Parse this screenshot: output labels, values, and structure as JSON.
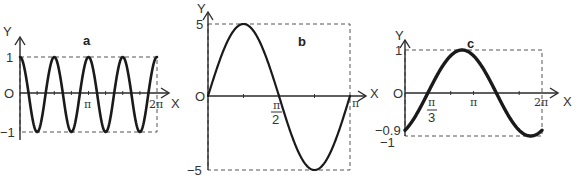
{
  "chart_data": [
    {
      "type": "line",
      "title": "a",
      "function": "y = cos(4x)",
      "xlabel": "X",
      "ylabel": "Y",
      "origin_label": "O",
      "xlim": [
        0,
        6.2832
      ],
      "ylim": [
        -1,
        1
      ],
      "x_ticks": [
        "π",
        "2π"
      ],
      "y_ticks": [
        "1",
        "-1"
      ],
      "amplitude": 1,
      "frequency": 4,
      "phase": 0,
      "fn": "cos",
      "px": {
        "x0": 20,
        "x1": 157,
        "y_top": 57,
        "y_zero": 93,
        "y_bot": 132
      },
      "stroke_width": 2.6,
      "minor_ticks": 16
    },
    {
      "type": "line",
      "title": "b",
      "function": "y = 5 sin(2x)",
      "xlabel": "X",
      "ylabel": "Y",
      "origin_label": "O",
      "xlim": [
        0,
        3.1416
      ],
      "ylim": [
        -5,
        5
      ],
      "x_ticks": [
        "π/2",
        "π"
      ],
      "y_ticks": [
        "5",
        "-5"
      ],
      "amplitude": 5,
      "frequency": 2,
      "phase": 0,
      "fn": "sin",
      "px": {
        "x0": 208,
        "x1": 350,
        "y_top": 24,
        "y_zero": 96,
        "y_bot": 170
      },
      "stroke_width": 2.2,
      "minor_ticks": 4
    },
    {
      "type": "line",
      "title": "c",
      "function": "y = sin(x - π/3)",
      "xlabel": "X",
      "ylabel": "Y",
      "origin_label": "O",
      "xlim": [
        0,
        6.2832
      ],
      "ylim": [
        -1,
        1
      ],
      "x_ticks": [
        "π/3",
        "π",
        "2π"
      ],
      "y_ticks": [
        "1",
        "-0.9",
        "-1"
      ],
      "amplitude": 1,
      "frequency": 1,
      "phase": -1.0472,
      "fn": "sin",
      "px": {
        "x0": 405,
        "x1": 542,
        "y_top": 50,
        "y_zero": 93,
        "y_bot": 136
      },
      "stroke_width": 3.4,
      "minor_ticks": 6
    }
  ],
  "labels": {
    "a": {
      "title": "a",
      "y_axis": "Y",
      "x_axis": "X",
      "origin": "O",
      "y_top": "1",
      "y_bot": "−1",
      "x_pi": "π",
      "x_2pi": "2π"
    },
    "b": {
      "title": "b",
      "y_axis": "Y",
      "x_axis": "X",
      "origin": "O",
      "y_top": "5",
      "y_bot": "−5",
      "x_half_pi_num": "π",
      "x_half_pi_den": "2",
      "x_pi": "π"
    },
    "c": {
      "title": "c",
      "y_axis": "Y",
      "x_axis": "X",
      "origin": "O",
      "y_top": "1",
      "y_mid": "−0.9",
      "y_bot": "−1",
      "x_third_pi_num": "π",
      "x_third_pi_den": "3",
      "x_pi": "π",
      "x_2pi": "2π"
    },
    "stray": "X"
  }
}
